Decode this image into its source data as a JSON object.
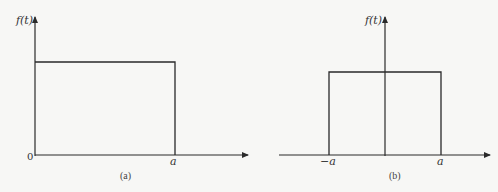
{
  "diagrams": [
    {
      "id": "a",
      "caption": "(a)",
      "y_label": "f(t)",
      "origin_label": "0",
      "x_tick_labels": [
        "a"
      ],
      "description": "Rectangular pulse from 0 to a"
    },
    {
      "id": "b",
      "caption": "(b)",
      "y_label": "f(t)",
      "x_tick_labels": [
        "−a",
        "a"
      ],
      "description": "Symmetric rectangular pulse from −a to a"
    }
  ],
  "colors": {
    "line": "#2a2a2a",
    "background": "#f7f7f5"
  }
}
